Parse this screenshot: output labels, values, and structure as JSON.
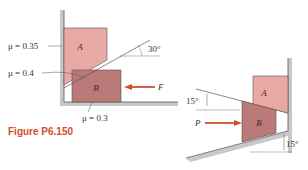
{
  "figure": {
    "caption": "Figure P6.150"
  },
  "left_diagram": {
    "block_a_label": "A",
    "block_b_label": "B",
    "mu_a_wall": "μ = 0.35",
    "mu_ab": "μ = 0.4",
    "mu_b_floor": "μ = 0.3",
    "angle": "30°",
    "force_label": "F"
  },
  "right_diagram": {
    "block_a_label": "A",
    "block_b_label": "B",
    "angle_top": "15°",
    "angle_bottom": "15°",
    "force_label": "P"
  },
  "colors": {
    "block_a": "#e8a8a4",
    "block_b": "#b97a78",
    "arrow": "#d0502a",
    "wall": "#c8c8c8",
    "caption": "#d0502a"
  }
}
